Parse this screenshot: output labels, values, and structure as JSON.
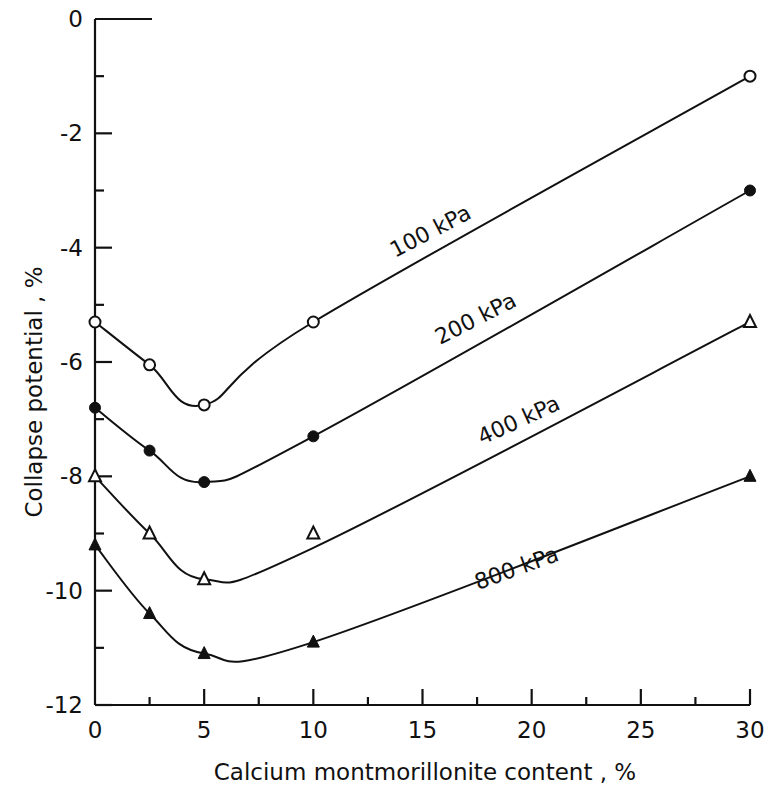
{
  "chart_data": {
    "type": "line",
    "title": "",
    "xlabel": "Calcium montmorillonite content , %",
    "ylabel": "Collapse potential , %",
    "xlim": [
      0,
      30
    ],
    "ylim": [
      -12,
      0
    ],
    "x_ticks": [
      0,
      5,
      10,
      15,
      20,
      25,
      30
    ],
    "x_tick_labels": [
      "0",
      "5",
      "10",
      "15",
      "20",
      "25",
      "30"
    ],
    "x_minor_ticks": [
      2.5,
      7.5,
      12.5,
      17.5,
      22.5,
      27.5
    ],
    "y_ticks": [
      0,
      -2,
      -4,
      -6,
      -8,
      -10,
      -12
    ],
    "y_tick_labels": [
      "0",
      "-2",
      "-4",
      "-6",
      "-8",
      "-10",
      "-12"
    ],
    "y_minor_ticks": [
      -1,
      -3,
      -5,
      -7,
      -9,
      -11
    ],
    "grid": false,
    "legend": "inline labels on curves",
    "x": [
      0,
      2.5,
      5,
      10,
      30
    ],
    "series": [
      {
        "name": "100 kPa",
        "marker": "open-circle",
        "values": [
          -5.3,
          -6.05,
          -6.75,
          -5.3,
          -1.0
        ]
      },
      {
        "name": "200 kPa",
        "marker": "filled-circle",
        "values": [
          -6.8,
          -7.55,
          -8.1,
          -7.3,
          -3.0
        ]
      },
      {
        "name": "400 kPa",
        "marker": "open-triangle",
        "values": [
          -8.0,
          -9.0,
          -9.8,
          -9.0,
          -5.3
        ]
      },
      {
        "name": "800 kPa",
        "marker": "filled-triangle",
        "values": [
          -9.2,
          -10.4,
          -11.1,
          -10.9,
          -8.0
        ]
      }
    ],
    "curve_points_note": "400 kPa point at x=10 plotted slightly above the fitted curve"
  }
}
